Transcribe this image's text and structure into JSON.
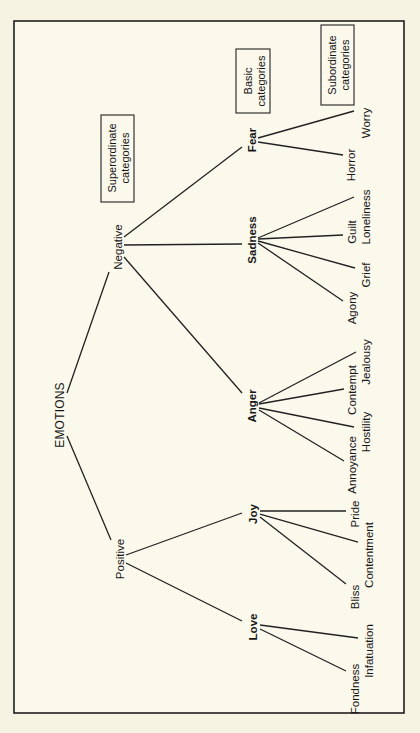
{
  "diagram": {
    "orientation": "rotated-90-ccw",
    "colors": {
      "background": "#f7f3e3",
      "frame": "#1e1e1e",
      "line": "#222222",
      "text": "#161616"
    },
    "legend": {
      "superordinate": [
        "Superordinate",
        "categories"
      ],
      "basic": [
        "Basic",
        "categories"
      ],
      "subordinate": [
        "Subordinate",
        "categories"
      ]
    },
    "root": "EMOTIONS",
    "superordinate": {
      "positive": "Positive",
      "negative": "Negative"
    },
    "basic": {
      "love": "Love",
      "joy": "Joy",
      "anger": "Anger",
      "sadness": "Sadness",
      "fear": "Fear"
    },
    "subordinate": {
      "love": [
        "Fondness",
        "Infatuation"
      ],
      "joy": [
        "Bliss",
        "Contentment",
        "Pride"
      ],
      "anger": [
        "Annoyance",
        "Hostility",
        "Contempt",
        "Jealousy"
      ],
      "sadness": [
        "Agony",
        "Grief",
        "Guilt",
        "Loneliness"
      ],
      "fear": [
        "Horror",
        "Worry"
      ]
    }
  }
}
